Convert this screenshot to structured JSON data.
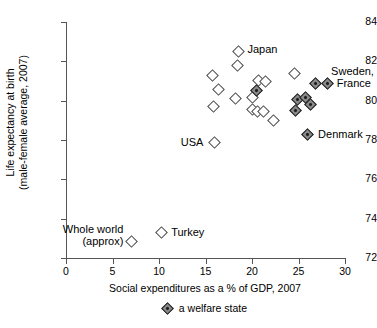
{
  "chart_data": {
    "type": "scatter",
    "title": "",
    "xlabel": "Social expenditures as a % of GDP, 2007",
    "ylabel": "Life expectancy at birth\n(male-female average, 2007)",
    "ylabel_line1": "Life expectancy at birth",
    "ylabel_line2": "(male-female average, 2007)",
    "xlim": [
      0,
      30
    ],
    "ylim": [
      72,
      84
    ],
    "xticks": [
      0,
      5,
      10,
      15,
      20,
      25,
      30
    ],
    "yticks": [
      72,
      74,
      76,
      78,
      80,
      82,
      84
    ],
    "xtick_labels": [
      "0",
      "5",
      "10",
      "15",
      "20",
      "25",
      "30"
    ],
    "ytick_labels": [
      "72",
      "74",
      "76",
      "78",
      "80",
      "82",
      "84"
    ],
    "grid": false,
    "legend_position": "below-axis",
    "legend": [
      {
        "marker": "filled-diamond",
        "label": "a welfare state"
      }
    ],
    "series": [
      {
        "name": "other country",
        "marker": "open-diamond",
        "points": [
          {
            "x": 7.0,
            "y": 72.85,
            "label": "Whole world (approx)",
            "label_pos": "left"
          },
          {
            "x": 10.3,
            "y": 73.3,
            "label": "Turkey",
            "label_pos": "right"
          },
          {
            "x": 16.0,
            "y": 77.85,
            "label": "USA",
            "label_pos": "left"
          },
          {
            "x": 18.5,
            "y": 82.5,
            "label": "Japan",
            "label_pos": "right"
          },
          {
            "x": 18.4,
            "y": 81.8,
            "label": "",
            "label_pos": ""
          },
          {
            "x": 15.8,
            "y": 81.3,
            "label": "",
            "label_pos": ""
          },
          {
            "x": 16.4,
            "y": 80.55,
            "label": "",
            "label_pos": ""
          },
          {
            "x": 15.9,
            "y": 79.7,
            "label": "",
            "label_pos": ""
          },
          {
            "x": 18.2,
            "y": 80.1,
            "label": "",
            "label_pos": ""
          },
          {
            "x": 20.0,
            "y": 80.15,
            "label": "",
            "label_pos": ""
          },
          {
            "x": 20.7,
            "y": 81.05,
            "label": "",
            "label_pos": ""
          },
          {
            "x": 21.4,
            "y": 81.0,
            "label": "",
            "label_pos": ""
          },
          {
            "x": 20.0,
            "y": 79.55,
            "label": "",
            "label_pos": ""
          },
          {
            "x": 20.6,
            "y": 79.45,
            "label": "",
            "label_pos": ""
          },
          {
            "x": 21.2,
            "y": 79.45,
            "label": "",
            "label_pos": ""
          },
          {
            "x": 22.3,
            "y": 79.0,
            "label": "",
            "label_pos": ""
          },
          {
            "x": 24.6,
            "y": 81.4,
            "label": "",
            "label_pos": ""
          }
        ]
      },
      {
        "name": "a welfare state",
        "marker": "filled-diamond",
        "points": [
          {
            "x": 20.5,
            "y": 80.5,
            "label": "",
            "label_pos": ""
          },
          {
            "x": 26.8,
            "y": 80.85,
            "label": "Sweden, France",
            "label_pos": "right"
          },
          {
            "x": 28.1,
            "y": 80.85,
            "label": "",
            "label_pos": ""
          },
          {
            "x": 24.9,
            "y": 80.05,
            "label": "",
            "label_pos": ""
          },
          {
            "x": 25.7,
            "y": 80.15,
            "label": "",
            "label_pos": ""
          },
          {
            "x": 26.3,
            "y": 79.8,
            "label": "",
            "label_pos": ""
          },
          {
            "x": 24.7,
            "y": 79.5,
            "label": "",
            "label_pos": ""
          },
          {
            "x": 26.0,
            "y": 78.3,
            "label": "Denmark",
            "label_pos": "right"
          }
        ]
      }
    ],
    "annotations": [
      {
        "text": "Japan",
        "x": 19.4,
        "y": 82.6
      },
      {
        "text": "Sweden,",
        "x": 28.4,
        "y": 81.5
      },
      {
        "text": "France",
        "x": 29.0,
        "y": 80.85
      },
      {
        "text": "Denmark",
        "x": 27.0,
        "y": 78.3
      },
      {
        "text": "USA",
        "x": 15.2,
        "y": 77.85
      },
      {
        "text": "Whole world",
        "x": 6.6,
        "y": 73.45
      },
      {
        "text": "(approx)",
        "x": 6.6,
        "y": 72.85
      },
      {
        "text": "Turkey",
        "x": 11.2,
        "y": 73.3
      }
    ]
  }
}
